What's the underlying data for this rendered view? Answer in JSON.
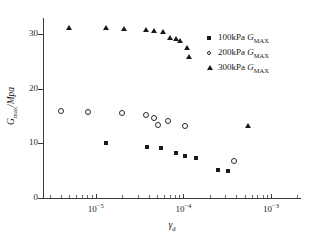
{
  "chart_data": {
    "type": "scatter",
    "title": "",
    "xlabel": "γd",
    "ylabel": "Gmax/Mpa",
    "xscale": "log",
    "xlim": [
      2.5e-06,
      0.0022
    ],
    "ylim": [
      0,
      33
    ],
    "yticks": [
      0,
      10,
      20,
      30
    ],
    "xticks": [
      1e-05,
      0.0001,
      0.001
    ],
    "xticklabels": [
      "10−5",
      "10−4",
      "10−3"
    ],
    "grid": false,
    "legend_position": "top-right",
    "series": [
      {
        "name": "100kPa GMAX",
        "marker": "filled-square",
        "color": "#1a1a1a",
        "points": [
          {
            "x": 1.3e-05,
            "y": 10.1
          },
          {
            "x": 3.8e-05,
            "y": 9.3
          },
          {
            "x": 5.6e-05,
            "y": 9.2
          },
          {
            "x": 8.3e-05,
            "y": 8.2
          },
          {
            "x": 0.000105,
            "y": 7.7
          },
          {
            "x": 0.00014,
            "y": 7.3
          },
          {
            "x": 0.00025,
            "y": 5.1
          },
          {
            "x": 0.00032,
            "y": 5.0
          }
        ]
      },
      {
        "name": "200kPa GMAX",
        "marker": "open-circle",
        "color": "#2a2a2a",
        "points": [
          {
            "x": 4e-06,
            "y": 16.0
          },
          {
            "x": 8.2e-06,
            "y": 15.8
          },
          {
            "x": 2e-05,
            "y": 15.6
          },
          {
            "x": 3.7e-05,
            "y": 15.3
          },
          {
            "x": 4.6e-05,
            "y": 14.6
          },
          {
            "x": 5.2e-05,
            "y": 13.3
          },
          {
            "x": 6.6e-05,
            "y": 14.1
          },
          {
            "x": 0.000105,
            "y": 13.2
          },
          {
            "x": 0.00038,
            "y": 6.7
          }
        ]
      },
      {
        "name": "300kPa GMAX",
        "marker": "filled-triangle",
        "color": "#1a1a1a",
        "points": [
          {
            "x": 5e-06,
            "y": 31.2
          },
          {
            "x": 1.3e-05,
            "y": 31.2
          },
          {
            "x": 2.1e-05,
            "y": 31.0
          },
          {
            "x": 3.7e-05,
            "y": 30.8
          },
          {
            "x": 4.6e-05,
            "y": 30.7
          },
          {
            "x": 5.8e-05,
            "y": 30.5
          },
          {
            "x": 7e-05,
            "y": 29.4
          },
          {
            "x": 8.2e-05,
            "y": 29.2
          },
          {
            "x": 9.2e-05,
            "y": 28.7
          },
          {
            "x": 0.00011,
            "y": 27.5
          },
          {
            "x": 0.000115,
            "y": 25.9
          },
          {
            "x": 0.00054,
            "y": 13.2
          }
        ]
      }
    ]
  },
  "legend": {
    "entries": [
      {
        "prefix": "100kPa ",
        "symbol": "G",
        "sub": "MAX"
      },
      {
        "prefix": "200kPa ",
        "symbol": "G",
        "sub": "MAX"
      },
      {
        "prefix": "300kPa ",
        "symbol": "G",
        "sub": "MAX"
      }
    ]
  },
  "axes": {
    "y_title_main": "G",
    "y_title_sub": "max",
    "y_title_tail": "/Mpa",
    "x_title_main": "γ",
    "x_title_sub": "d"
  }
}
